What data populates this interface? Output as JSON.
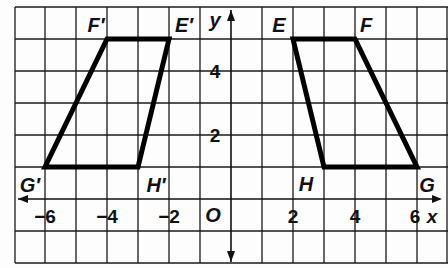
{
  "figure": {
    "axes": {
      "x_label": "x",
      "y_label": "y",
      "origin_label": "O",
      "x_ticks": [
        {
          "value": -6,
          "label": "−6"
        },
        {
          "value": -4,
          "label": "−4"
        },
        {
          "value": -2,
          "label": "−2"
        },
        {
          "value": 2,
          "label": "2"
        },
        {
          "value": 4,
          "label": "4"
        },
        {
          "value": 6,
          "label": "6"
        }
      ],
      "y_ticks": [
        {
          "value": 2,
          "label": "2"
        },
        {
          "value": 4,
          "label": "4"
        }
      ],
      "x_range": [
        -7,
        7
      ],
      "y_range": [
        -2,
        6
      ],
      "grid": true
    },
    "shapes": [
      {
        "name": "EFGH",
        "vertices": [
          {
            "label": "E",
            "x": 2,
            "y": 5
          },
          {
            "label": "F",
            "x": 4,
            "y": 5
          },
          {
            "label": "G",
            "x": 6,
            "y": 1
          },
          {
            "label": "H",
            "x": 3,
            "y": 1
          }
        ]
      },
      {
        "name": "E'F'G'H'",
        "vertices": [
          {
            "label": "E′",
            "x": -2,
            "y": 5
          },
          {
            "label": "F′",
            "x": -4,
            "y": 5
          },
          {
            "label": "G′",
            "x": -6,
            "y": 1
          },
          {
            "label": "H′",
            "x": -3,
            "y": 1
          }
        ]
      }
    ],
    "colors": {
      "grid": "#1a1a1a",
      "shape_stroke": "#000000",
      "background": "#fdfdfd"
    }
  }
}
